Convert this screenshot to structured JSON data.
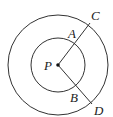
{
  "diagram": {
    "center": {
      "label": "P",
      "x": 58,
      "y": 65
    },
    "circles": [
      {
        "name": "outer",
        "r": 50
      },
      {
        "name": "inner",
        "r": 27
      }
    ],
    "points": {
      "A": {
        "label": "A",
        "lx": 68,
        "ly": 38
      },
      "B": {
        "label": "B",
        "lx": 70,
        "ly": 102
      },
      "C": {
        "label": "C",
        "lx": 91,
        "ly": 20
      },
      "D": {
        "label": "D",
        "lx": 94,
        "ly": 115
      }
    },
    "segments": [
      {
        "from": "P",
        "to": "C",
        "x2": 90,
        "y2": 23
      },
      {
        "from": "P",
        "to": "D",
        "x2": 92,
        "y2": 104
      }
    ],
    "stroke_color": "#333333"
  }
}
